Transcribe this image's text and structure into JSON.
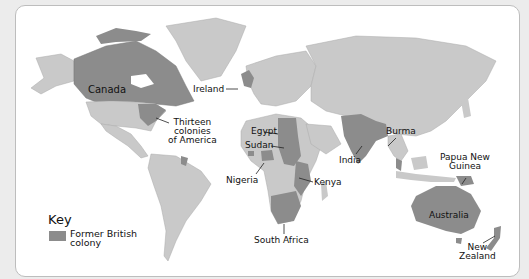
{
  "map": {
    "colors": {
      "background": "#ececec",
      "ocean": "#ffffff",
      "land": "#c9c9c9",
      "colony": "#8c8c8c",
      "border": "#bdbdbd"
    },
    "labels": {
      "canada": "Canada",
      "ireland": "Ireland",
      "thirteen_colonies": [
        "Thirteen",
        "colonies",
        "of America"
      ],
      "egypt": "Egypt",
      "sudan": "Sudan",
      "nigeria": "Nigeria",
      "kenya": "Kenya",
      "south_africa": "South Africa",
      "india": "India",
      "burma": "Burma",
      "papua_new_guinea": [
        "Papua New",
        "Guinea"
      ],
      "australia": "Australia",
      "new_zealand": [
        "New",
        "Zealand"
      ]
    }
  },
  "key": {
    "title": "Key",
    "items": [
      {
        "label_line1": "Former British",
        "label_line2": "colony",
        "color": "#8c8c8c"
      }
    ]
  }
}
